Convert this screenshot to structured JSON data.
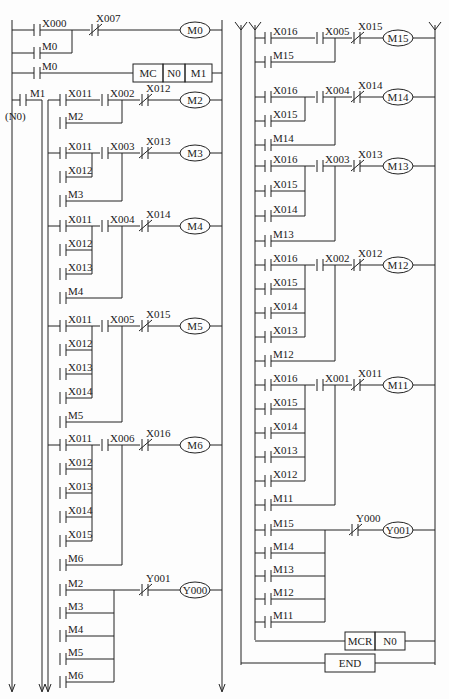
{
  "diagram": {
    "type": "plc-ladder-diagram",
    "left_panel": {
      "rungs": [
        {
          "contacts": [
            {
              "name": "X000",
              "type": "NO"
            },
            {
              "name": "X007",
              "type": "NC"
            }
          ],
          "parallel": [
            "M0"
          ],
          "output": {
            "type": "coil",
            "name": "M0"
          }
        },
        {
          "contacts": [
            {
              "name": "M0",
              "type": "NO"
            }
          ],
          "output": {
            "type": "instruction",
            "cells": [
              "MC",
              "N0",
              "M1"
            ]
          }
        },
        {
          "mc_contact": "M1",
          "mc_label": "(N0)",
          "contacts": [
            {
              "name": "X011",
              "type": "NO"
            },
            {
              "name": "X002",
              "type": "NO"
            },
            {
              "name": "X012",
              "type": "NC"
            }
          ],
          "parallel": [
            "M2"
          ],
          "output": {
            "type": "coil",
            "name": "M2"
          }
        },
        {
          "contacts": [
            {
              "name": "X011",
              "type": "NO"
            },
            {
              "name": "X003",
              "type": "NO"
            },
            {
              "name": "X013",
              "type": "NC"
            }
          ],
          "or_group": [
            "X012"
          ],
          "parallel": [
            "M3"
          ],
          "output": {
            "type": "coil",
            "name": "M3"
          }
        },
        {
          "contacts": [
            {
              "name": "X011",
              "type": "NO"
            },
            {
              "name": "X004",
              "type": "NO"
            },
            {
              "name": "X014",
              "type": "NC"
            }
          ],
          "or_group": [
            "X012",
            "X013"
          ],
          "parallel": [
            "M4"
          ],
          "output": {
            "type": "coil",
            "name": "M4"
          }
        },
        {
          "contacts": [
            {
              "name": "X011",
              "type": "NO"
            },
            {
              "name": "X005",
              "type": "NO"
            },
            {
              "name": "X015",
              "type": "NC"
            }
          ],
          "or_group": [
            "X012",
            "X013",
            "X014"
          ],
          "parallel": [
            "M5"
          ],
          "output": {
            "type": "coil",
            "name": "M5"
          }
        },
        {
          "contacts": [
            {
              "name": "X011",
              "type": "NO"
            },
            {
              "name": "X006",
              "type": "NO"
            },
            {
              "name": "X016",
              "type": "NC"
            }
          ],
          "or_group": [
            "X012",
            "X013",
            "X014",
            "X015"
          ],
          "parallel": [
            "M6"
          ],
          "output": {
            "type": "coil",
            "name": "M6"
          }
        },
        {
          "contacts": [
            {
              "name": "M2",
              "type": "NO"
            },
            {
              "name": "Y001",
              "type": "NC"
            }
          ],
          "or_group": [
            "M3",
            "M4",
            "M5",
            "M6"
          ],
          "output": {
            "type": "coil",
            "name": "Y000"
          }
        }
      ]
    },
    "right_panel": {
      "rungs": [
        {
          "contacts": [
            {
              "name": "X016",
              "type": "NO"
            },
            {
              "name": "X005",
              "type": "NO"
            },
            {
              "name": "X015",
              "type": "NC"
            }
          ],
          "parallel": [
            "M15"
          ],
          "output": {
            "type": "coil",
            "name": "M15"
          }
        },
        {
          "contacts": [
            {
              "name": "X016",
              "type": "NO"
            },
            {
              "name": "X004",
              "type": "NO"
            },
            {
              "name": "X014",
              "type": "NC"
            }
          ],
          "or_group": [
            "X015"
          ],
          "parallel": [
            "M14"
          ],
          "output": {
            "type": "coil",
            "name": "M14"
          }
        },
        {
          "contacts": [
            {
              "name": "X016",
              "type": "NO"
            },
            {
              "name": "X003",
              "type": "NO"
            },
            {
              "name": "X013",
              "type": "NC"
            }
          ],
          "or_group": [
            "X015",
            "X014"
          ],
          "parallel": [
            "M13"
          ],
          "output": {
            "type": "coil",
            "name": "M13"
          }
        },
        {
          "contacts": [
            {
              "name": "X016",
              "type": "NO"
            },
            {
              "name": "X002",
              "type": "NO"
            },
            {
              "name": "X012",
              "type": "NC"
            }
          ],
          "or_group": [
            "X015",
            "X014",
            "X013"
          ],
          "parallel": [
            "M12"
          ],
          "output": {
            "type": "coil",
            "name": "M12"
          }
        },
        {
          "contacts": [
            {
              "name": "X016",
              "type": "NO"
            },
            {
              "name": "X001",
              "type": "NO"
            },
            {
              "name": "X011",
              "type": "NC"
            }
          ],
          "or_group": [
            "X015",
            "X014",
            "X013",
            "X012"
          ],
          "parallel": [
            "M11"
          ],
          "output": {
            "type": "coil",
            "name": "M11"
          }
        },
        {
          "contacts": [
            {
              "name": "M15",
              "type": "NO"
            },
            {
              "name": "Y000",
              "type": "NC"
            }
          ],
          "or_group": [
            "M14",
            "M13",
            "M12",
            "M11"
          ],
          "output": {
            "type": "coil",
            "name": "Y001"
          }
        },
        {
          "output": {
            "type": "instruction",
            "cells": [
              "MCR",
              "N0"
            ]
          }
        },
        {
          "output": {
            "type": "instruction",
            "cells": [
              "END"
            ]
          }
        }
      ]
    }
  }
}
